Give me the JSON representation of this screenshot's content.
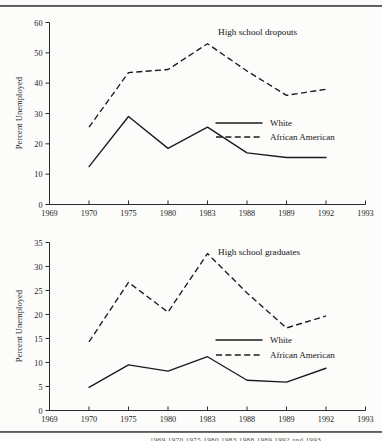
{
  "figure": {
    "series_names": {
      "white": "White",
      "african_american": "African American"
    },
    "y_axis_title": "Percent Unemployed",
    "footer_partial_text": "1969 1970 1975 1980 1983 1988 1989 1992 and 1993"
  },
  "chart_data": [
    {
      "id": "high-school-dropouts",
      "type": "line",
      "title": "High school dropouts",
      "xlabel": "",
      "ylabel": "Percent Unemployed",
      "x": [
        1969,
        1970,
        1975,
        1980,
        1983,
        1988,
        1989,
        1992,
        1993
      ],
      "xtick_labels": [
        "1969",
        "1970",
        "1975",
        "1980",
        "1983",
        "1988",
        "1989",
        "1992",
        "1993"
      ],
      "ytick_labels": [
        "0",
        "10",
        "20",
        "30",
        "40",
        "50",
        "60"
      ],
      "yticks": [
        0,
        10,
        20,
        30,
        40,
        50,
        60
      ],
      "ylim": [
        0,
        60
      ],
      "xlim": [
        1969,
        1993
      ],
      "grid": false,
      "legend_position": "center-right",
      "series": [
        {
          "name": "White",
          "style": "solid",
          "x": [
            1970,
            1975,
            1980,
            1983,
            1988,
            1989,
            1992
          ],
          "values": [
            12.5,
            29.0,
            18.5,
            25.5,
            17.0,
            15.5,
            15.5
          ]
        },
        {
          "name": "African American",
          "style": "dashed",
          "x": [
            1970,
            1975,
            1980,
            1983,
            1988,
            1989,
            1992
          ],
          "values": [
            25.5,
            43.5,
            44.5,
            53.0,
            44.0,
            36.0,
            38.0
          ]
        }
      ]
    },
    {
      "id": "high-school-graduates",
      "type": "line",
      "title": "High school graduates",
      "xlabel": "",
      "ylabel": "Percent Unemployed",
      "x": [
        1969,
        1970,
        1975,
        1980,
        1983,
        1988,
        1989,
        1992,
        1993
      ],
      "xtick_labels": [
        "1969",
        "1970",
        "1975",
        "1980",
        "1983",
        "1988",
        "1989",
        "1992",
        "1993"
      ],
      "ytick_labels": [
        "0",
        "5",
        "10",
        "15",
        "20",
        "25",
        "30",
        "35"
      ],
      "yticks": [
        0,
        5,
        10,
        15,
        20,
        25,
        30,
        35
      ],
      "ylim": [
        0,
        35
      ],
      "xlim": [
        1969,
        1993
      ],
      "grid": false,
      "legend_position": "center-right",
      "series": [
        {
          "name": "White",
          "style": "solid",
          "x": [
            1970,
            1975,
            1980,
            1983,
            1988,
            1989,
            1992
          ],
          "values": [
            4.8,
            9.5,
            8.2,
            11.2,
            6.3,
            5.9,
            8.8
          ]
        },
        {
          "name": "African American",
          "style": "dashed",
          "x": [
            1970,
            1975,
            1980,
            1983,
            1988,
            1989,
            1992
          ],
          "values": [
            14.3,
            26.7,
            20.5,
            32.7,
            24.5,
            17.2,
            19.7
          ]
        }
      ]
    }
  ]
}
